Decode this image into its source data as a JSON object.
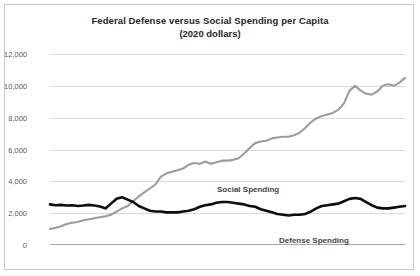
{
  "chart_data": {
    "type": "line",
    "title": "Federal Defense versus Social Spending per Capita",
    "subtitle": "(2020 dollars)",
    "xlabel": "",
    "ylabel": "",
    "xlim": [
      1955,
      2019
    ],
    "ylim": [
      0,
      12000
    ],
    "grid": true,
    "legend_position": "inline-annotations",
    "ytick_labels": [
      "12,000",
      "10,000",
      "8,000",
      "6,000",
      "4,000",
      "2,000",
      "0"
    ],
    "ytick_values": [
      12000,
      10000,
      8000,
      6000,
      4000,
      2000,
      0
    ],
    "xtick_labels": [
      "1955",
      "1965",
      "1975",
      "1985",
      "1995",
      "2005",
      "2015"
    ],
    "xtick_values": [
      1955,
      1965,
      1975,
      1985,
      1995,
      2005,
      2015
    ],
    "annotations": [
      {
        "text": "Social Spending",
        "x": 1978,
        "y": 6400
      },
      {
        "text": "Defense Spending",
        "x": 1994,
        "y": 3300
      }
    ],
    "colors": {
      "social": "#9c9c9c",
      "defense": "#0d0d0d",
      "gridline": "#d9d9d9",
      "axis": "#a6a6a6",
      "border": "#c8c8c8",
      "text": "#595959",
      "title": "#262626"
    },
    "series": [
      {
        "name": "Social Spending",
        "color": "#9c9c9c",
        "x": [
          1955,
          1956,
          1957,
          1958,
          1959,
          1960,
          1961,
          1962,
          1963,
          1964,
          1965,
          1966,
          1967,
          1968,
          1969,
          1970,
          1971,
          1972,
          1973,
          1974,
          1975,
          1976,
          1977,
          1978,
          1979,
          1980,
          1981,
          1982,
          1983,
          1984,
          1985,
          1986,
          1987,
          1988,
          1989,
          1990,
          1991,
          1992,
          1993,
          1994,
          1995,
          1996,
          1997,
          1998,
          1999,
          2000,
          2001,
          2002,
          2003,
          2004,
          2005,
          2006,
          2007,
          2008,
          2009,
          2010,
          2011,
          2012,
          2013,
          2014,
          2015,
          2016,
          2017,
          2018,
          2019
        ],
        "values": [
          1000,
          1080,
          1180,
          1320,
          1400,
          1450,
          1560,
          1620,
          1680,
          1740,
          1800,
          1900,
          2100,
          2300,
          2450,
          2750,
          3050,
          3300,
          3550,
          3800,
          4300,
          4500,
          4600,
          4700,
          4800,
          5050,
          5150,
          5100,
          5250,
          5100,
          5200,
          5300,
          5300,
          5350,
          5450,
          5750,
          6100,
          6400,
          6500,
          6550,
          6700,
          6750,
          6800,
          6800,
          6900,
          7050,
          7350,
          7700,
          7950,
          8100,
          8200,
          8300,
          8500,
          8900,
          9700,
          10000,
          9700,
          9500,
          9450,
          9650,
          10000,
          10100,
          10000,
          10200,
          10500
        ]
      },
      {
        "name": "Defense Spending",
        "color": "#0d0d0d",
        "x": [
          1955,
          1956,
          1957,
          1958,
          1959,
          1960,
          1961,
          1962,
          1963,
          1964,
          1965,
          1966,
          1967,
          1968,
          1969,
          1970,
          1971,
          1972,
          1973,
          1974,
          1975,
          1976,
          1977,
          1978,
          1979,
          1980,
          1981,
          1982,
          1983,
          1984,
          1985,
          1986,
          1987,
          1988,
          1989,
          1990,
          1991,
          1992,
          1993,
          1994,
          1995,
          1996,
          1997,
          1998,
          1999,
          2000,
          2001,
          2002,
          2003,
          2004,
          2005,
          2006,
          2007,
          2008,
          2009,
          2010,
          2011,
          2012,
          2013,
          2014,
          2015,
          2016,
          2017,
          2018,
          2019
        ],
        "values": [
          2550,
          2500,
          2520,
          2480,
          2500,
          2450,
          2480,
          2520,
          2480,
          2420,
          2300,
          2600,
          2900,
          3000,
          2850,
          2700,
          2450,
          2300,
          2150,
          2100,
          2100,
          2050,
          2050,
          2050,
          2100,
          2150,
          2250,
          2400,
          2500,
          2550,
          2650,
          2700,
          2700,
          2650,
          2600,
          2550,
          2450,
          2400,
          2250,
          2150,
          2050,
          1950,
          1900,
          1850,
          1900,
          1900,
          1950,
          2100,
          2300,
          2450,
          2500,
          2550,
          2600,
          2750,
          2900,
          2950,
          2900,
          2700,
          2500,
          2350,
          2300,
          2300,
          2350,
          2400,
          2450
        ]
      }
    ]
  }
}
